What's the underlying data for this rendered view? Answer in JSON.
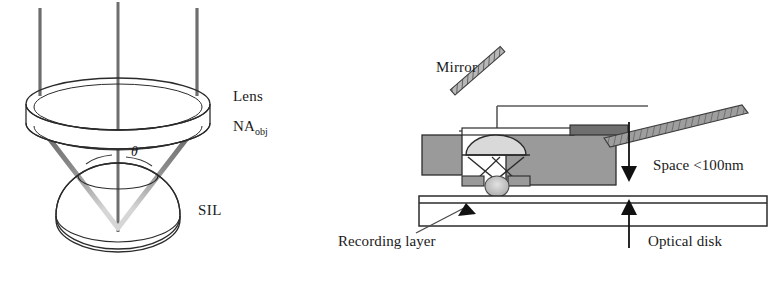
{
  "figure": {
    "caption_present": false,
    "background_color": "#ffffff",
    "ink_color": "#1a1a1a"
  },
  "left_diagram": {
    "name": "solid-immersion-lens-optics",
    "labels": {
      "lens": "Lens",
      "na_prefix": "NA",
      "na_subscript": "obj",
      "sil": "SIL",
      "theta": "θ"
    },
    "colors": {
      "outline": "#2b2b2b",
      "ray_dark": "#6b6b6b",
      "ray_light": "#c9c9c9",
      "lens_fill": "#ffffff"
    },
    "geometry": {
      "incoming_rays_x": [
        40,
        118,
        197
      ],
      "incoming_rays_y_top": 8,
      "lens_center": [
        118,
        104
      ],
      "lens_rx": 92,
      "lens_ry": 26,
      "lens_thickness": 19,
      "focus_point": [
        118,
        225
      ],
      "sil_center": [
        118,
        215
      ],
      "sil_rx": 62,
      "sil_ry": 48
    }
  },
  "right_diagram": {
    "name": "flying-head-over-optical-disk",
    "labels": {
      "mirror": "Mirror",
      "space": "Space <100nm",
      "recording_layer": "Recording layer",
      "optical_disk": "Optical disk"
    },
    "colors": {
      "outline": "#2b2b2b",
      "block_fill": "#9a9a9a",
      "arm_fill": "#8a8a8a",
      "dome_fill": "#d9d9d9",
      "disk_fill": "#ffffff",
      "arrow_fill": "#111111"
    },
    "geometry": {
      "slider_top_y": 131,
      "slider_bottom_y": 186,
      "disk_top_y": 196,
      "disk_bottom_y": 226,
      "disk_left_x": 419,
      "disk_right_x": 767,
      "gap_arrow_x": 629,
      "mirror_angle_deg": 45
    }
  }
}
